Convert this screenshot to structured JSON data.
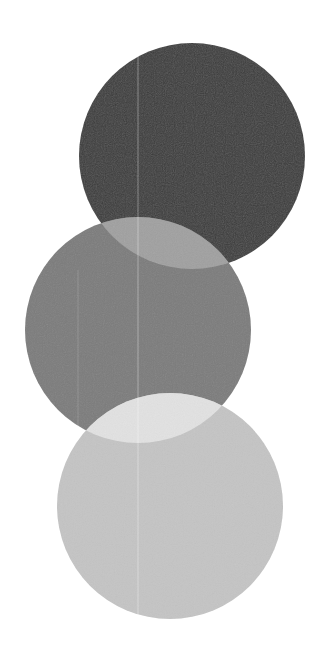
{
  "canvas": {
    "width": 336,
    "height": 670,
    "background": "#ffffff"
  },
  "circles": [
    {
      "name": "dark-circle",
      "cx": 192,
      "cy": 156,
      "r": 113,
      "color": "#3c3c3c"
    },
    {
      "name": "medium-circle",
      "cx": 138,
      "cy": 330,
      "r": 113,
      "color": "#7c7c7c"
    },
    {
      "name": "light-circle",
      "cx": 170,
      "cy": 506,
      "r": 113,
      "color": "#c4c4c4"
    }
  ],
  "overlaps": [
    {
      "name": "dark-medium-overlap",
      "color": "#a0a0a0"
    },
    {
      "name": "medium-light-overlap",
      "color": "#e2e2e2"
    }
  ],
  "streaks": [
    {
      "x": 138,
      "y1": 55,
      "y2": 640,
      "color": "#ffffff",
      "opacity": 0.35
    },
    {
      "x": 78,
      "y1": 270,
      "y2": 440,
      "color": "#ffffff",
      "opacity": 0.15
    }
  ]
}
